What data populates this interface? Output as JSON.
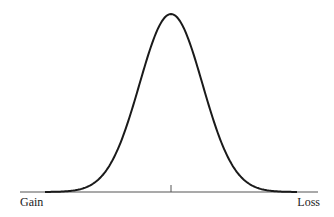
{
  "chart_data": {
    "type": "line",
    "title": "",
    "xlabel": "",
    "ylabel": "",
    "x_axis_endpoints": {
      "left": "Gain",
      "right": "Loss"
    },
    "center_tick": true,
    "grid": false,
    "legend": null,
    "series": [
      {
        "name": "distribution",
        "shape": "normal",
        "mean": 0,
        "sd": 1,
        "x": [
          -4,
          -3.5,
          -3,
          -2.5,
          -2,
          -1.5,
          -1,
          -0.5,
          0,
          0.5,
          1,
          1.5,
          2,
          2.5,
          3,
          3.5,
          4
        ],
        "values": [
          0.0001,
          0.0009,
          0.0044,
          0.0175,
          0.054,
          0.1295,
          0.242,
          0.3521,
          0.3989,
          0.3521,
          0.242,
          0.1295,
          0.054,
          0.0175,
          0.0044,
          0.0009,
          0.0001
        ]
      }
    ]
  },
  "labels": {
    "left": "Gain",
    "right": "Loss"
  },
  "colors": {
    "curve": "#1a1a1a",
    "axis": "#555555"
  }
}
